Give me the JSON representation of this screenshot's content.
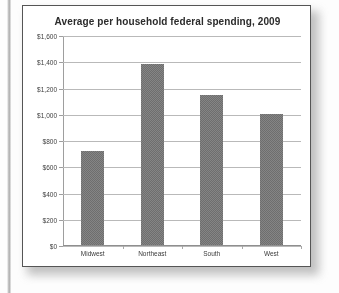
{
  "chart_data": {
    "type": "bar",
    "title": "Average per household federal spending, 2009",
    "xlabel": "",
    "ylabel": "",
    "categories": [
      "Midwest",
      "Northeast",
      "South",
      "West"
    ],
    "values": [
      720,
      1380,
      1140,
      1000
    ],
    "ylim": [
      0,
      1600
    ],
    "yticks": [
      0,
      200,
      400,
      600,
      800,
      1000,
      1200,
      1400,
      1600
    ],
    "ytick_labels": [
      "$0",
      "$200",
      "$400",
      "$600",
      "$800",
      "$1,000",
      "$1,200",
      "$1,400",
      "$1,600"
    ],
    "grid": true,
    "legend": "none",
    "bar_color": "#6e6e6e",
    "gridline_color": "#b9b9b9",
    "axis_color": "#9e9e9e",
    "background_color": "#ffffff",
    "frame_color": "#555555"
  }
}
